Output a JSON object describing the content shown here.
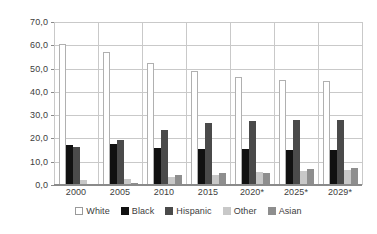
{
  "chart_data": {
    "type": "bar",
    "title": "",
    "subtitle": "",
    "xlabel": "",
    "ylabel": "",
    "ylim": [
      0.0,
      70.0
    ],
    "ytick_step": 10.0,
    "ytick_labels": [
      "70,0",
      "60,0",
      "50,0",
      "40,0",
      "30,0",
      "20,0",
      "10,0",
      "0,0"
    ],
    "ytick_values": [
      70.0,
      60.0,
      50.0,
      40.0,
      30.0,
      20.0,
      10.0,
      0.0
    ],
    "grid": true,
    "grid_axis": "both",
    "legend_position": "bottom",
    "categories": [
      "2000",
      "2005",
      "2010",
      "2015",
      "2020*",
      "2025*",
      "2029*"
    ],
    "series": [
      {
        "name": "White",
        "color": "#ffffff",
        "values": [
          60.5,
          57.0,
          52.5,
          49.0,
          46.5,
          45.0,
          44.5
        ]
      },
      {
        "name": "Black",
        "color": "#111111",
        "values": [
          17.0,
          17.5,
          16.0,
          15.5,
          15.5,
          15.0,
          15.0
        ]
      },
      {
        "name": "Hispanic",
        "color": "#4a4a4a",
        "values": [
          16.5,
          19.5,
          23.5,
          26.5,
          27.5,
          28.0,
          28.0
        ]
      },
      {
        "name": "Other",
        "color": "#c8c8c8",
        "values": [
          2.0,
          2.5,
          3.5,
          4.5,
          5.5,
          6.0,
          6.5
        ]
      },
      {
        "name": "Asian",
        "color": "#8e8e8e",
        "values": [
          0.5,
          1.0,
          4.5,
          5.0,
          5.0,
          7.0,
          7.5
        ]
      }
    ]
  }
}
